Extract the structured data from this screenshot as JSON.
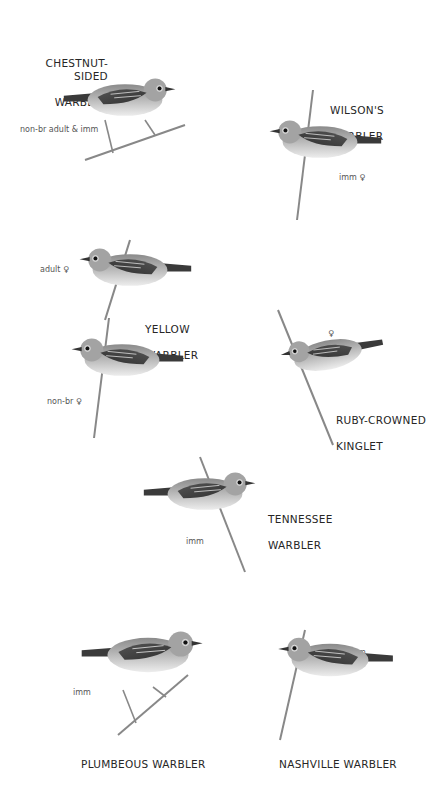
{
  "plate": {
    "background": "#ffffff",
    "text_color": "#262626",
    "birds": [
      {
        "id": "chestnut-sided",
        "name_line1": "CHESTNUT-SIDED",
        "name_line2": "WARBLER",
        "annotation": "non-br adult & imm"
      },
      {
        "id": "wilsons",
        "name_line1": "WILSON'S",
        "name_line2": "WARBLER",
        "annotation": "imm ♀"
      },
      {
        "id": "yellow",
        "name_line1": "YELLOW",
        "name_line2": "WARBLER",
        "annotation": "adult ♀",
        "annotation2": "non-br ♀"
      },
      {
        "id": "ruby-crowned",
        "name_line1": "RUBY-CROWNED",
        "name_line2": "KINGLET",
        "annotation": "♀"
      },
      {
        "id": "tennessee",
        "name_line1": "TENNESSEE",
        "name_line2": "WARBLER",
        "annotation": "imm"
      },
      {
        "id": "plumbeous",
        "name_line1": "PLUMBEOUS WARBLER",
        "annotation": "imm"
      },
      {
        "id": "nashville",
        "name_line1": "NASHVILLE WARBLER",
        "annotation": "imm"
      }
    ]
  }
}
